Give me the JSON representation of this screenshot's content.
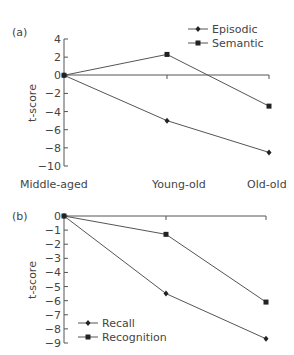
{
  "chart_data": [
    {
      "panel": "(a)",
      "type": "line",
      "categories": [
        "Middle-aged",
        "Young-old",
        "Old-old"
      ],
      "ylabel": "t-score",
      "xlabel": "",
      "ylim": [
        -10,
        4
      ],
      "yticks": [
        4,
        2,
        0,
        -2,
        -4,
        -6,
        -8,
        -10
      ],
      "ytick_labels": [
        "4",
        "2",
        "0",
        "−2",
        "−4",
        "−6",
        "−8",
        "−10"
      ],
      "legend_position": "top-right",
      "series": [
        {
          "name": "Episodic",
          "marker": "diamond",
          "values": [
            0,
            -5.0,
            -8.5
          ]
        },
        {
          "name": "Semantic",
          "marker": "square",
          "values": [
            0,
            2.3,
            -3.4
          ]
        }
      ]
    },
    {
      "panel": "(b)",
      "type": "line",
      "categories": [
        "Middle-aged",
        "Young-old",
        "Old-old"
      ],
      "ylabel": "t-score",
      "xlabel": "",
      "ylim": [
        -9,
        0
      ],
      "yticks": [
        0,
        -1,
        -2,
        -3,
        -4,
        -5,
        -6,
        -7,
        -8,
        -9
      ],
      "ytick_labels": [
        "0",
        "−1",
        "−2",
        "−3",
        "−4",
        "−5",
        "−6",
        "−7",
        "−8",
        "−9"
      ],
      "legend_position": "bottom-left",
      "series": [
        {
          "name": "Recall",
          "marker": "diamond",
          "values": [
            0,
            -5.5,
            -8.7
          ]
        },
        {
          "name": "Recognition",
          "marker": "square",
          "values": [
            0,
            -1.3,
            -6.1
          ]
        }
      ]
    }
  ],
  "labels": {
    "panel_a": "(a)",
    "panel_b": "(b)",
    "ylabel": "t-score",
    "categories": [
      "Middle-aged",
      "Young-old",
      "Old-old"
    ],
    "legend_a": [
      "Episodic",
      "Semantic"
    ],
    "legend_b": [
      "Recall",
      "Recognition"
    ]
  }
}
